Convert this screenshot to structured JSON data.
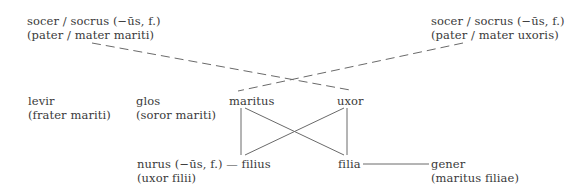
{
  "diagram": {
    "type": "kinship",
    "nodes": {
      "socer_husband": {
        "line1": "socer / socrus (−ūs, f.)",
        "line2": "(pater / mater mariti)"
      },
      "socer_wife": {
        "line1": "socer / socrus (−ūs, f.)",
        "line2": "(pater / mater uxoris)"
      },
      "levir": {
        "line1": "levir",
        "line2": "(frater mariti)"
      },
      "glos": {
        "line1": "glos",
        "line2": "(soror mariti)"
      },
      "maritus": {
        "line1": "maritus"
      },
      "uxor": {
        "line1": "uxor"
      },
      "nurus": {
        "line1": "nurus (−ūs, f.) — filius",
        "line2": "(uxor filii)"
      },
      "filia": {
        "line1": "filia"
      },
      "gener": {
        "line1": "gener",
        "line2": "(maritus filiae)"
      }
    },
    "edges": [
      {
        "from": "socer_husband",
        "to": "uxor",
        "style": "dashed"
      },
      {
        "from": "socer_wife",
        "to": "maritus",
        "style": "dashed"
      },
      {
        "from": "maritus",
        "to": "filius",
        "style": "solid"
      },
      {
        "from": "maritus",
        "to": "filia",
        "style": "solid"
      },
      {
        "from": "uxor",
        "to": "filius",
        "style": "solid"
      },
      {
        "from": "uxor",
        "to": "filia",
        "style": "solid"
      },
      {
        "from": "nurus",
        "to": "filius",
        "style": "solid"
      },
      {
        "from": "filia",
        "to": "gener",
        "style": "solid"
      }
    ],
    "line_color": "#6a6a6a"
  }
}
